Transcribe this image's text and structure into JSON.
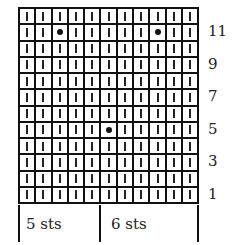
{
  "chart": {
    "columns": 11,
    "rows": 12,
    "symbols": {
      "knit": "vertical-bar",
      "purl": "dot"
    },
    "purl_cells": [
      {
        "row_from_top": 1,
        "col": 2
      },
      {
        "row_from_top": 1,
        "col": 8
      },
      {
        "row_from_top": 7,
        "col": 5
      }
    ],
    "row_labels": [
      {
        "label": "11",
        "row_from_top": 1
      },
      {
        "label": "9",
        "row_from_top": 3
      },
      {
        "label": "7",
        "row_from_top": 5
      },
      {
        "label": "5",
        "row_from_top": 7
      },
      {
        "label": "3",
        "row_from_top": 9
      },
      {
        "label": "1",
        "row_from_top": 11
      }
    ],
    "stitch_groups": [
      {
        "label": "5 sts",
        "span": 5
      },
      {
        "label": "6 sts",
        "span": 6
      }
    ]
  }
}
